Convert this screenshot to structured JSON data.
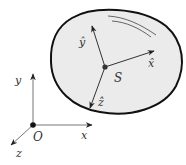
{
  "diagram": {
    "body": {
      "fill": "#ebebeb",
      "stroke": "#111111",
      "center_label": "S"
    },
    "body_axes": {
      "x_label": "x̂",
      "y_label": "ŷ",
      "z_label": "ẑ"
    },
    "inertial_frame": {
      "origin_label": "O",
      "x_label": "x",
      "y_label": "y",
      "z_label": "z"
    },
    "colors": {
      "axis": "#333333",
      "inertial_axis": "#777777",
      "highlight": "#555555"
    }
  }
}
